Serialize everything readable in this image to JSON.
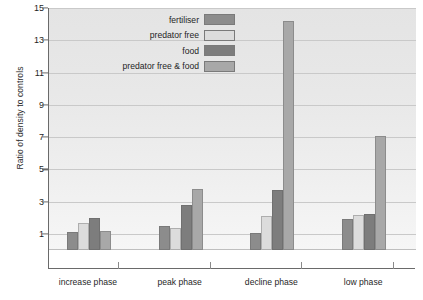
{
  "chart_data": {
    "type": "bar",
    "title": "",
    "xlabel": "",
    "ylabel": "Ratio of density to controls",
    "categories": [
      "increase phase",
      "peak phase",
      "decline phase",
      "low phase"
    ],
    "ylim": [
      0,
      15
    ],
    "yticks": [
      1,
      3,
      5,
      7,
      9,
      11,
      13,
      15
    ],
    "ytick_labels": [
      "1",
      "3",
      "5",
      "7",
      "9",
      "11",
      "13",
      "15"
    ],
    "grid": true,
    "baseline": 1,
    "legend_position": "top-center",
    "series": [
      {
        "name": "fertiliser",
        "color": "#8c8c8c",
        "values": [
          1.1,
          1.5,
          1.05,
          1.9
        ]
      },
      {
        "name": "predator free",
        "color": "#dcdcdc",
        "values": [
          1.7,
          1.35,
          2.1,
          2.2
        ]
      },
      {
        "name": "food",
        "color": "#7d7d7d",
        "values": [
          2.0,
          2.8,
          3.75,
          2.25
        ]
      },
      {
        "name": "predator free & food",
        "color": "#a8a8a8",
        "values": [
          1.15,
          3.8,
          14.2,
          7.05
        ]
      }
    ]
  },
  "legend": {
    "items": [
      {
        "label": "fertiliser",
        "color": "#8c8c8c"
      },
      {
        "label": "predator free",
        "color": "#dcdcdc"
      },
      {
        "label": "food",
        "color": "#7d7d7d"
      },
      {
        "label": "predator free & food",
        "color": "#a8a8a8"
      }
    ]
  },
  "axes": {
    "y_title": "Ratio of density to controls"
  }
}
